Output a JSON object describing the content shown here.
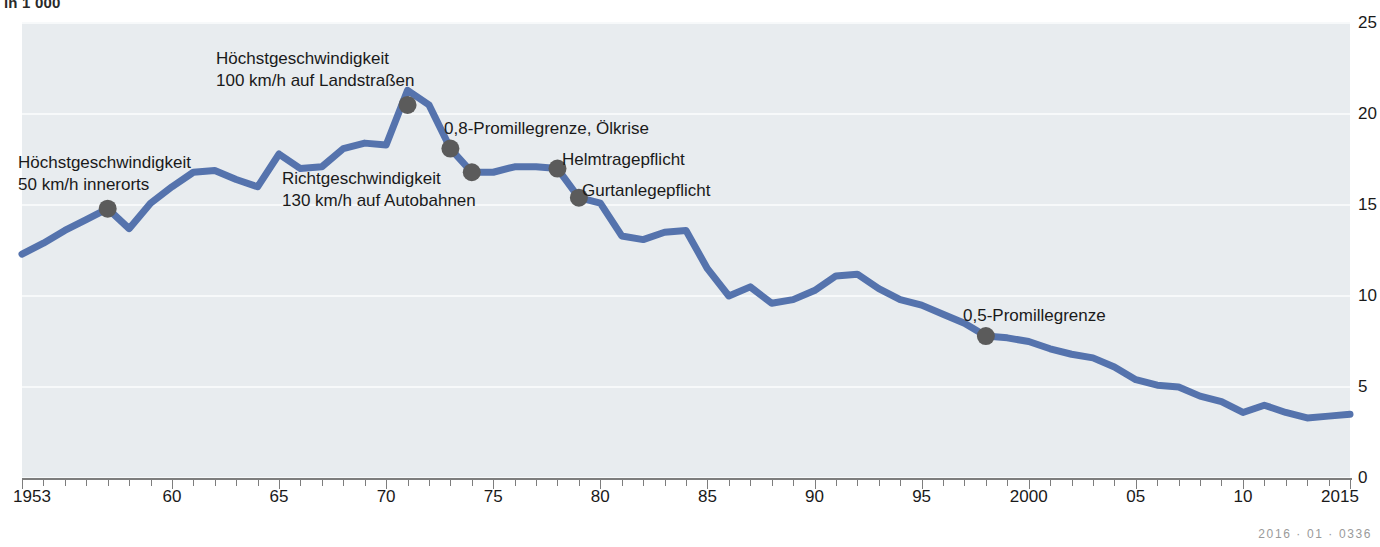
{
  "unit_caption": "in 1 000",
  "credit": "2016 · 01 · 0336",
  "colors": {
    "line": "#5573ad",
    "marker": "#5b5b5b",
    "plot_background": "#e8ecef",
    "gridline": "#f7f9fa",
    "axis": "#7d7d7d"
  },
  "annotations": [
    {
      "id": "hoechst-50",
      "lines": [
        "Höchstgeschwindigkeit",
        "50 km/h innerorts"
      ],
      "x": 18,
      "y": 152,
      "year": 1957,
      "value": 14.8
    },
    {
      "id": "hoechst-100",
      "lines": [
        "Höchstgeschwindigkeit",
        "100 km/h auf Landstraßen"
      ],
      "x": 216,
      "y": 48,
      "year": 1971,
      "value": 20.5
    },
    {
      "id": "richtgeschw-130",
      "lines": [
        "Richtgeschwindigkeit",
        "130 km/h auf Autobahnen"
      ],
      "x": 282,
      "y": 168,
      "year": 1974,
      "value": 16.8
    },
    {
      "id": "promille-08",
      "lines": [
        "0,8-Promillegrenze, Ölkrise"
      ],
      "x": 444,
      "y": 118,
      "year": 1973,
      "value": 18.1
    },
    {
      "id": "helmtragepflicht",
      "lines": [
        "Helmtragepflicht"
      ],
      "x": 562,
      "y": 149,
      "year": 1978,
      "value": 17.0
    },
    {
      "id": "gurtanlegepflicht",
      "lines": [
        "Gurtanlegepflicht"
      ],
      "x": 582,
      "y": 180,
      "year": 1979,
      "value": 15.4
    },
    {
      "id": "promille-05",
      "lines": [
        "0,5-Promillegrenze"
      ],
      "x": 963,
      "y": 305,
      "year": 1998,
      "value": 7.8
    }
  ],
  "chart_data": {
    "type": "line",
    "title": "",
    "subtitle": "",
    "xlabel": "",
    "ylabel": "in 1 000",
    "xlim": [
      1953,
      2015
    ],
    "ylim": [
      0,
      25
    ],
    "y_ticks": [
      0,
      5,
      10,
      15,
      20,
      25
    ],
    "x_ticks": [
      1953,
      1960,
      1965,
      1970,
      1975,
      1980,
      1985,
      1990,
      1995,
      2000,
      2005,
      2010,
      2015
    ],
    "x_tick_labels": [
      "1953",
      "60",
      "65",
      "70",
      "75",
      "80",
      "85",
      "90",
      "95",
      "2000",
      "05",
      "10",
      "2015"
    ],
    "grid": true,
    "legend": "none",
    "series": [
      {
        "name": "Verkehrstote",
        "color": "#5573ad",
        "x": [
          1953,
          1954,
          1955,
          1956,
          1957,
          1958,
          1959,
          1960,
          1961,
          1962,
          1963,
          1964,
          1965,
          1966,
          1967,
          1968,
          1969,
          1970,
          1971,
          1972,
          1973,
          1974,
          1975,
          1976,
          1977,
          1978,
          1979,
          1980,
          1981,
          1982,
          1983,
          1984,
          1985,
          1986,
          1987,
          1988,
          1989,
          1990,
          1991,
          1992,
          1993,
          1994,
          1995,
          1996,
          1997,
          1998,
          1999,
          2000,
          2001,
          2002,
          2003,
          2004,
          2005,
          2006,
          2007,
          2008,
          2009,
          2010,
          2011,
          2012,
          2013,
          2014,
          2015
        ],
        "values": [
          12.3,
          12.9,
          13.6,
          14.2,
          14.8,
          13.7,
          15.1,
          16.0,
          16.8,
          16.9,
          16.4,
          16.0,
          17.8,
          17.0,
          17.1,
          18.1,
          18.4,
          18.3,
          21.3,
          20.5,
          18.1,
          16.8,
          16.8,
          17.1,
          17.1,
          17.0,
          15.4,
          15.1,
          13.3,
          13.1,
          13.5,
          13.6,
          11.5,
          10.0,
          10.5,
          9.6,
          9.8,
          10.3,
          11.1,
          11.2,
          10.4,
          9.8,
          9.5,
          9.0,
          8.5,
          7.8,
          7.7,
          7.5,
          7.1,
          6.8,
          6.6,
          6.1,
          5.4,
          5.1,
          5.0,
          4.5,
          4.2,
          3.6,
          4.0,
          3.6,
          3.3,
          3.4,
          3.5
        ]
      }
    ],
    "markers": [
      {
        "year": 1957,
        "value": 14.8,
        "label": "Höchstgeschwindigkeit 50 km/h innerorts"
      },
      {
        "year": 1971,
        "value": 20.5,
        "label": "Höchstgeschwindigkeit 100 km/h auf Landstraßen"
      },
      {
        "year": 1973,
        "value": 18.1,
        "label": "0,8-Promillegrenze, Ölkrise"
      },
      {
        "year": 1974,
        "value": 16.8,
        "label": "Richtgeschwindigkeit 130 km/h auf Autobahnen"
      },
      {
        "year": 1978,
        "value": 17.0,
        "label": "Helmtragepflicht"
      },
      {
        "year": 1979,
        "value": 15.4,
        "label": "Gurtanlegepflicht"
      },
      {
        "year": 1998,
        "value": 7.8,
        "label": "0,5-Promillegrenze"
      }
    ]
  }
}
